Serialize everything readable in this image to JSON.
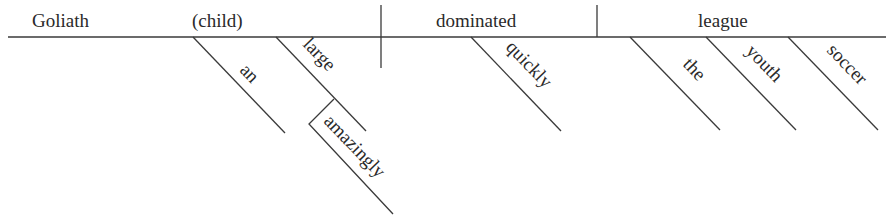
{
  "diagram": {
    "type": "reed-kellogg-sentence-diagram",
    "sentence": "Goliath, an amazingly large child, quickly dominated the youth soccer league.",
    "subject": {
      "word": "Goliath",
      "appositive": "(child)",
      "appositive_modifiers": [
        "an",
        "large"
      ],
      "modifier_of_large": "amazingly"
    },
    "verb": {
      "word": "dominated",
      "modifiers": [
        "quickly"
      ]
    },
    "object": {
      "word": "league",
      "modifiers": [
        "the",
        "youth",
        "soccer"
      ]
    }
  }
}
